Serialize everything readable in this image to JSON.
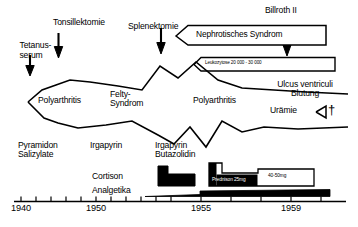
{
  "figure": {
    "kind": "medical-case-history-timeline",
    "language": "de"
  },
  "events": [
    {
      "id": "tetanusserum",
      "label": "Tetanus-\nserum",
      "year_approx": 1940.2,
      "marker": "down-arrow"
    },
    {
      "id": "tonsillektomie",
      "label": "Tonsillektomie",
      "year_approx": 1942.0,
      "marker": "down-arrow"
    },
    {
      "id": "splenektomie",
      "label": "Splenektomie",
      "year_approx": 1949.8,
      "marker": "down-arrow"
    },
    {
      "id": "billroth2",
      "label": "Billroth II",
      "year_approx": 1957.3,
      "marker": "down-arrow"
    }
  ],
  "banners": [
    {
      "id": "nephrotisches-syndrom",
      "label": "Nephrotisches Syndrom",
      "start_year": 1950.6,
      "end_year": 1958.2
    },
    {
      "id": "leukozytose",
      "label": "Leukozytose 20 000 - 30 000",
      "start_year": 1951.0,
      "end_year": 1958.6
    }
  ],
  "band": {
    "id": "disease-activity-band",
    "description": "Zigzag activity envelope spanning the whole observation period",
    "labels": [
      {
        "id": "polyarthritis-1",
        "label": "Polyarthritis",
        "year_approx": 1942.3
      },
      {
        "id": "felty-syndrom",
        "label": "Felty-\nSyndrom",
        "year_approx": 1948.1
      },
      {
        "id": "polyarthritis-2",
        "label": "Polyarthritis",
        "year_approx": 1953.6
      }
    ],
    "upper": [
      [
        1939.6,
        90
      ],
      [
        1940.4,
        80
      ],
      [
        1941.2,
        76
      ],
      [
        1942.0,
        72
      ],
      [
        1943.2,
        74
      ],
      [
        1945.0,
        77
      ],
      [
        1946.4,
        80
      ],
      [
        1948.0,
        62
      ],
      [
        1949.2,
        70
      ],
      [
        1950.3,
        58
      ],
      [
        1951.6,
        72
      ],
      [
        1953.0,
        78
      ],
      [
        1955.0,
        80
      ],
      [
        1957.0,
        82
      ],
      [
        1959.6,
        84
      ]
    ],
    "lower": [
      [
        1939.6,
        90
      ],
      [
        1940.6,
        104
      ],
      [
        1941.4,
        108
      ],
      [
        1942.6,
        112
      ],
      [
        1944.4,
        110
      ],
      [
        1946.0,
        107
      ],
      [
        1947.4,
        118
      ],
      [
        1948.4,
        126
      ],
      [
        1949.4,
        113
      ],
      [
        1950.4,
        128
      ],
      [
        1951.4,
        108
      ],
      [
        1952.6,
        116
      ],
      [
        1954.0,
        112
      ],
      [
        1956.0,
        114
      ],
      [
        1959.6,
        112
      ]
    ]
  },
  "complications": [
    {
      "id": "ulcus-ventriculi",
      "label": "Ulcus ventriculi\nBlutung",
      "year_approx": 1957.3
    },
    {
      "id": "uraemie",
      "label": "Urämie",
      "year_approx": 1957.8
    }
  ],
  "outcome": {
    "id": "death",
    "symbol": "†",
    "year_approx": 1959.1
  },
  "drugs": [
    {
      "id": "pyramidon-salizylate",
      "label": "Pyramidon\nSalizylate",
      "year_approx": 1940.4
    },
    {
      "id": "irgapyrin-1",
      "label": "Irgapyrin",
      "year_approx": 1948.6
    },
    {
      "id": "irgapyrin-butazolidin",
      "label": "Irgapyrin\nButazolidin",
      "year_approx": 1953.7
    }
  ],
  "therapy_bars": [
    {
      "id": "cortison-bar",
      "label": "Cortison",
      "label_year": 1951.4,
      "start_year": 1953.0,
      "end_year": 1955.2
    },
    {
      "id": "prednison-bar",
      "label": "Prednison 25mg",
      "secondary_label": "40-50mg",
      "start_year": 1955.6,
      "end_year": 1959.4
    },
    {
      "id": "analgetika-bar",
      "label": "Analgetika",
      "label_year": 1952.1,
      "start_year": 1954.0,
      "end_year": 1959.5
    }
  ],
  "axis": {
    "id": "time-axis",
    "start_year": 1939.0,
    "end_year": 1960.4,
    "tick_labels": [
      "1940",
      "1950",
      "1955",
      "1959"
    ],
    "tick_years": [
      1940,
      1950,
      1955,
      1959
    ],
    "minor_tick_years": [
      1939,
      1940,
      1941,
      1942,
      1943,
      1944,
      1945,
      1946,
      1947,
      1948,
      1949,
      1950,
      1951,
      1952,
      1953,
      1954,
      1955,
      1956,
      1957,
      1958,
      1959,
      1960
    ]
  },
  "colors": {
    "ink": "#000000",
    "paper": "#ffffff"
  }
}
